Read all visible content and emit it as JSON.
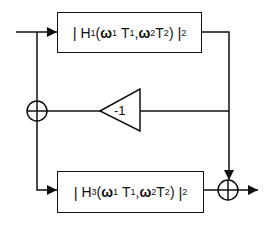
{
  "diagram": {
    "type": "block-diagram",
    "blocks": [
      {
        "id": "H1",
        "open_bar": "|",
        "func": "H",
        "func_sub": "1",
        "open_paren": "(",
        "w1": "ω",
        "w1_sub": "1",
        "t1": "T",
        "t1_sub": "1",
        "comma": ",",
        "w2": "ω",
        "w2_sub": "2",
        "t2": "T",
        "t2_sub": "2",
        "close_paren": ")",
        "close_bar": "|",
        "power": "2"
      },
      {
        "id": "H3",
        "open_bar": "|",
        "func": "H",
        "func_sub": "3",
        "open_paren": "(",
        "w1": "ω",
        "w1_sub": "1",
        "t1": "T",
        "t1_sub": "1",
        "comma": ",",
        "w2": "ω",
        "w2_sub": "2",
        "t2": "T",
        "t2_sub": "2",
        "close_paren": ")",
        "close_bar": "|",
        "power": "2"
      }
    ],
    "gain": {
      "label": "-1"
    },
    "summing_junctions": [
      {
        "id": "sum-left",
        "symbol": "⊕"
      },
      {
        "id": "sum-right",
        "symbol": "⊕"
      }
    ],
    "colors": {
      "stroke": "#111111",
      "background": "#ffffff"
    }
  }
}
